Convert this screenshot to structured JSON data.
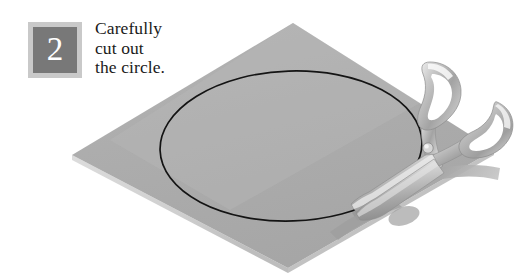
{
  "step": {
    "number": "2",
    "badge_fill_color": "#787878",
    "badge_frame_color": "#c9c9c9",
    "number_color": "#ffffff"
  },
  "instruction": {
    "lines": [
      "Carefully",
      "cut out",
      "the circle."
    ],
    "full_text": "Carefully cut out the circle.",
    "text_color": "#1a1a1a"
  },
  "illustration": {
    "background_color": "#ffffff",
    "paper": {
      "name": "square-sheet-of-paper",
      "shape": "diamond",
      "fill_color": "#adadad",
      "edge_highlight_color": "#d4d4d4",
      "corners": {
        "top": [
          293,
          23
        ],
        "right": [
          494,
          150
        ],
        "bottom": [
          288,
          268
        ],
        "left": [
          72,
          155
        ]
      }
    },
    "guide_circle": {
      "name": "drawn-circle-outline",
      "shape": "ellipse",
      "stroke_color": "#141414",
      "stroke_width": 1.7,
      "center": [
        291,
        146
      ],
      "radius_x": 131,
      "radius_y": 75,
      "rotation_deg": -2
    },
    "scissors": {
      "name": "scissors",
      "body_color": "#b9b9b9",
      "highlight_color": "#e8e8e8",
      "shadow_color": "#9a9a9a",
      "pivot": [
        428,
        148
      ],
      "blade_tip": [
        349,
        203
      ],
      "handle_loops": 2
    }
  }
}
